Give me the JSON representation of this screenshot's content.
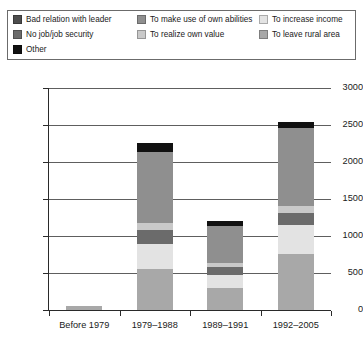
{
  "legend": {
    "rows": [
      [
        {
          "label": "Bad relation with leader",
          "color": "#4d4d4d"
        },
        {
          "label": "To make use of own abilities",
          "color": "#8f8f8f"
        },
        {
          "label": "To increase income",
          "color": "#e3e3e3"
        }
      ],
      [
        {
          "label": "No job/job security",
          "color": "#6b6b6b"
        },
        {
          "label": "To realize own value",
          "color": "#c9c9c9"
        },
        {
          "label": "To leave rural area",
          "color": "#a8a8a8"
        }
      ],
      [
        {
          "label": "Other",
          "color": "#111111"
        }
      ]
    ]
  },
  "chart_data": {
    "type": "bar",
    "stacked": true,
    "title": "",
    "xlabel": "",
    "ylabel": "",
    "ylim": [
      0,
      3000
    ],
    "ytick_labels": [
      "0",
      "500",
      "1000",
      "1500",
      "2000",
      "2500",
      "3000"
    ],
    "ytick_values": [
      0,
      500,
      1000,
      1500,
      2000,
      2500,
      3000
    ],
    "grid": true,
    "legend_position": "top",
    "categories": [
      "Before 1979",
      "1979–1988",
      "1989–1991",
      "1992–2005"
    ],
    "series": [
      {
        "name": "To leave rural area",
        "color": "#a8a8a8",
        "values": [
          60,
          560,
          300,
          760
        ]
      },
      {
        "name": "To increase income",
        "color": "#e3e3e3",
        "values": [
          0,
          330,
          180,
          390
        ]
      },
      {
        "name": "No job/job security",
        "color": "#6b6b6b",
        "values": [
          0,
          190,
          100,
          160
        ]
      },
      {
        "name": "To realize own value",
        "color": "#c9c9c9",
        "values": [
          0,
          90,
          60,
          90
        ]
      },
      {
        "name": "To make use of own abilities",
        "color": "#8f8f8f",
        "values": [
          0,
          960,
          500,
          1060
        ]
      },
      {
        "name": "Bad relation with leader",
        "color": "#4d4d4d",
        "values": [
          0,
          0,
          0,
          0
        ]
      },
      {
        "name": "Other",
        "color": "#111111",
        "values": [
          0,
          130,
          60,
          80
        ]
      }
    ],
    "totals": [
      60,
      2260,
      1200,
      2540
    ]
  }
}
